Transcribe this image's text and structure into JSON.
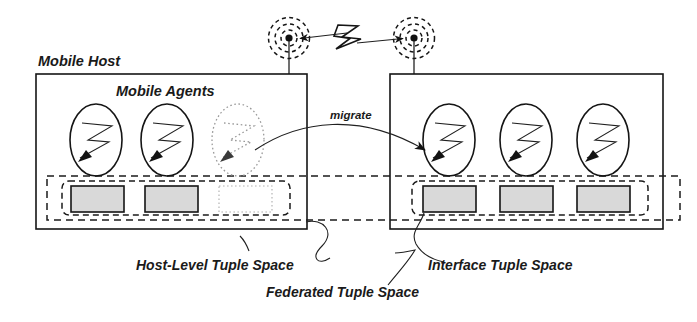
{
  "figure": {
    "title_text": "Mobile Host / Mobile Agents federated tuple space diagram",
    "labels": {
      "mobile_host": "Mobile Host",
      "mobile_agents": "Mobile Agents",
      "migrate": "migrate",
      "host_level_tuple_space": "Host-Level Tuple Space",
      "federated_tuple_space": "Federated Tuple Space",
      "interface_tuple_space": "Interface Tuple Space"
    },
    "colors": {
      "ink": "#151515",
      "tuple_fill": "#d9d9d9",
      "ghost": "#9a9a9a",
      "background": "#ffffff"
    },
    "hosts": [
      {
        "name": "left-mobile-host",
        "labelled": true,
        "agents": [
          {
            "name": "agent-1",
            "state": "resident",
            "icon": "lightning-bolt-icon"
          },
          {
            "name": "agent-2",
            "state": "resident",
            "icon": "lightning-bolt-icon"
          },
          {
            "name": "agent-3",
            "state": "departing",
            "icon": "lightning-bolt-icon"
          }
        ],
        "tuple_boxes": [
          {
            "name": "tuple-box-1",
            "state": "filled"
          },
          {
            "name": "tuple-box-2",
            "state": "filled"
          },
          {
            "name": "tuple-box-3",
            "state": "ghost"
          }
        ],
        "antenna": {
          "name": "antenna-left",
          "rings": 3
        }
      },
      {
        "name": "right-mobile-host",
        "labelled": false,
        "agents": [
          {
            "name": "agent-4",
            "state": "resident",
            "icon": "lightning-bolt-icon"
          },
          {
            "name": "agent-5",
            "state": "resident",
            "icon": "lightning-bolt-icon"
          },
          {
            "name": "agent-6",
            "state": "resident",
            "icon": "lightning-bolt-icon"
          }
        ],
        "tuple_boxes": [
          {
            "name": "tuple-box-4",
            "state": "filled"
          },
          {
            "name": "tuple-box-5",
            "state": "filled"
          },
          {
            "name": "tuple-box-6",
            "state": "filled"
          }
        ],
        "antenna": {
          "name": "antenna-right",
          "rings": 3
        }
      }
    ],
    "links": [
      {
        "name": "wireless-link",
        "icon": "lightning-bolt-icon",
        "arrows": "bidirectional"
      },
      {
        "name": "migrate-arrow",
        "label": "migrate",
        "arrows": "right"
      }
    ]
  }
}
